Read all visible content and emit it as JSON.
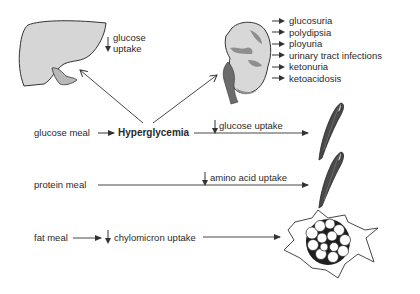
{
  "diagram": {
    "central_node": "Hyperglycemia",
    "inputs": {
      "glucose_meal": "glucose meal",
      "protein_meal": "protein meal",
      "fat_meal": "fat meal"
    },
    "liver": {
      "label_line1": "glucose",
      "label_line2": "uptake",
      "direction": "decreased"
    },
    "kidney": {
      "effects": [
        "glucosuria",
        "polydipsia",
        "ployuria",
        "urinary tract infections",
        "ketonuria",
        "ketoacidosis"
      ]
    },
    "muscle_glucose": {
      "label": "glucose uptake",
      "direction": "decreased"
    },
    "muscle_amino": {
      "label": "amino acid uptake",
      "direction": "decreased"
    },
    "adipose": {
      "label": "chylomicron uptake",
      "direction": "decreased"
    },
    "colors": {
      "organ_fill": "#d4d4d4",
      "muscle_fill": "#4a4a4a",
      "line": "#333333",
      "kidney_dark": "#8a8a8a"
    }
  }
}
